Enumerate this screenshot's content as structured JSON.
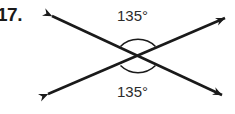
{
  "figure": {
    "problem_number": "17.",
    "background_color": "#ffffff",
    "stroke_color": "#1a1a1a",
    "text_color": "#2b2b2b"
  },
  "angles": {
    "top_label": "135°",
    "bottom_label": "135°"
  },
  "geometry": {
    "intersection": {
      "x": 138,
      "y": 56
    },
    "line_a": {
      "x1": 52,
      "y1": 16,
      "x2": 222,
      "y2": 95
    },
    "line_b": {
      "x1": 48,
      "y1": 94,
      "x2": 225,
      "y2": 18
    },
    "arc_radius": 25,
    "arrowheads": 4
  }
}
